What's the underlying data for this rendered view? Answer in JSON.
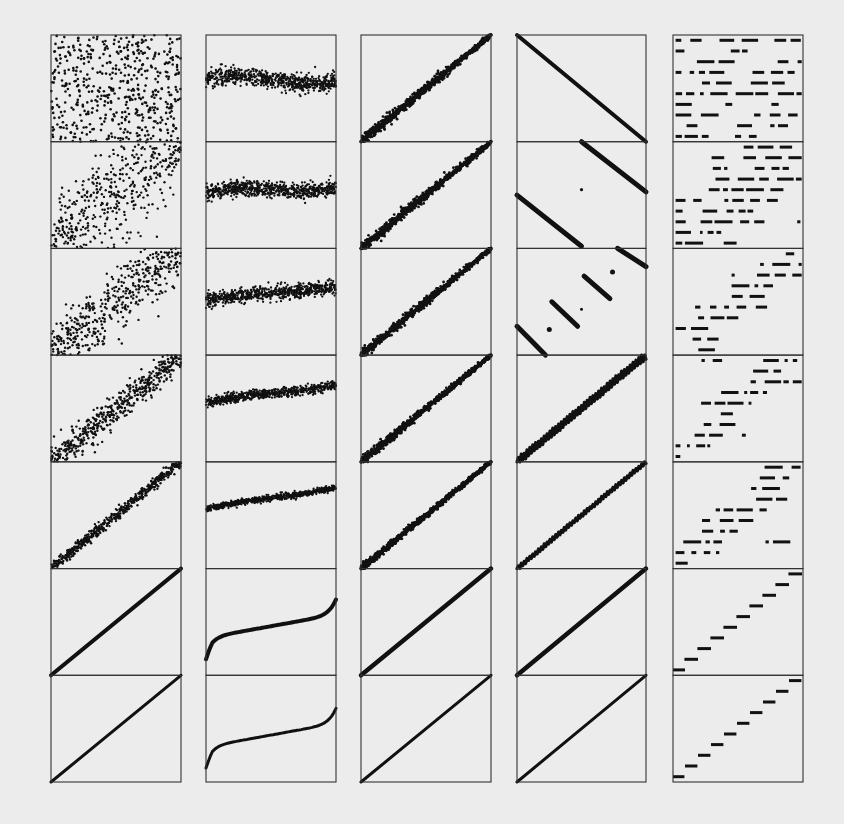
{
  "figure": {
    "background": "#ececec",
    "ink": "#111111",
    "frame_color": "#333333"
  },
  "layout": {
    "columns_x": [
      [
        51,
        181
      ],
      [
        206,
        336
      ],
      [
        361,
        491
      ],
      [
        517,
        646
      ],
      [
        673,
        803
      ]
    ],
    "top": 35,
    "bottom": 782,
    "rows": 7
  },
  "chart_data": {
    "type": "scatter",
    "title": "",
    "xlabel": "",
    "ylabel": "",
    "grid": false,
    "legend": null,
    "panel_grid": {
      "columns": 5,
      "rows": 7
    },
    "columns": [
      {
        "id": "col1",
        "pattern": "scatter from uniform noise (row 1) to perfect line y=x (row 7); correlation increases downward",
        "rows": [
          {
            "kind": "noise",
            "correlation": 0.0,
            "points": 600
          },
          {
            "kind": "noisy-line",
            "correlation": 0.3,
            "points": 600,
            "spread": 0.45
          },
          {
            "kind": "noisy-line",
            "correlation": 0.6,
            "points": 600,
            "spread": 0.28
          },
          {
            "kind": "noisy-line",
            "correlation": 0.85,
            "points": 600,
            "spread": 0.12
          },
          {
            "kind": "noisy-line",
            "correlation": 0.95,
            "points": 600,
            "spread": 0.05
          },
          {
            "kind": "line",
            "correlation": 0.999,
            "points": 600,
            "spread": 0.01
          },
          {
            "kind": "line",
            "correlation": 1.0,
            "points": 600,
            "spread": 0.0
          }
        ]
      },
      {
        "id": "col2",
        "pattern": "horizontal noisy band near 0.55-0.7 height; slope increases, noise decreases, ends in S-curve",
        "rows": [
          {
            "kind": "band",
            "level": 0.58,
            "slope": -0.02,
            "spread": 0.09
          },
          {
            "kind": "band",
            "level": 0.55,
            "slope": 0.06,
            "spread": 0.08
          },
          {
            "kind": "band",
            "level": 0.58,
            "slope": 0.12,
            "spread": 0.07
          },
          {
            "kind": "band",
            "level": 0.64,
            "slope": 0.16,
            "spread": 0.05
          },
          {
            "kind": "band",
            "level": 0.66,
            "slope": 0.2,
            "spread": 0.03
          },
          {
            "kind": "s-curve",
            "level": 0.64,
            "slope": 0.22,
            "spread": 0.01
          },
          {
            "kind": "s-curve",
            "level": 0.66,
            "slope": 0.22,
            "spread": 0.0
          }
        ]
      },
      {
        "id": "col3",
        "pattern": "diagonal y=x with noise that is wider near the lower-left; noise decreases downward",
        "rows": [
          {
            "kind": "funnel-line",
            "spread": 0.05
          },
          {
            "kind": "funnel-line",
            "spread": 0.05
          },
          {
            "kind": "funnel-line",
            "spread": 0.045
          },
          {
            "kind": "funnel-line",
            "spread": 0.04
          },
          {
            "kind": "funnel-line",
            "spread": 0.035
          },
          {
            "kind": "line",
            "spread": 0.012
          },
          {
            "kind": "line",
            "spread": 0.0
          }
        ]
      },
      {
        "id": "col4",
        "pattern": "descending line, then wraparound segments, then rising zigzag lines",
        "rows": [
          {
            "kind": "descending-line",
            "segments": 1
          },
          {
            "kind": "wrapped-descending",
            "segments": 2
          },
          {
            "kind": "wrapped-descending",
            "segments": 5
          },
          {
            "kind": "zigzag-rising",
            "amplitude": 0.04,
            "spread": 0.015
          },
          {
            "kind": "zigzag-rising",
            "amplitude": 0.02,
            "spread": 0.02
          },
          {
            "kind": "line",
            "spread": 0.01
          },
          {
            "kind": "line",
            "spread": 0.0
          }
        ]
      },
      {
        "id": "col5",
        "pattern": "10 discrete horizontal levels; random dashes become ordered staircase downward",
        "levels": 10,
        "rows": [
          {
            "kind": "levels-random",
            "order": 0.0
          },
          {
            "kind": "levels-partial",
            "order": 0.45
          },
          {
            "kind": "levels-partial",
            "order": 0.75
          },
          {
            "kind": "levels-staircase",
            "order": 0.9
          },
          {
            "kind": "levels-staircase",
            "order": 0.97
          },
          {
            "kind": "staircase",
            "order": 1.0,
            "gap": 0.35
          },
          {
            "kind": "staircase",
            "order": 1.0,
            "gap": 0.45
          }
        ]
      }
    ]
  }
}
